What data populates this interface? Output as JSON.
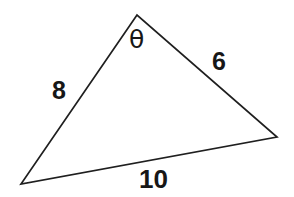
{
  "figure": {
    "type": "geometry-diagram",
    "shape": "triangle",
    "background_color": "#ffffff",
    "stroke_color": "#1f1f1f",
    "stroke_width": 1.7,
    "text_color": "#171717",
    "vertices": [
      {
        "name": "apex",
        "x": 137,
        "y": 15
      },
      {
        "name": "bottom-left",
        "x": 21,
        "y": 184
      },
      {
        "name": "right",
        "x": 277,
        "y": 137
      }
    ],
    "sides": [
      {
        "name": "left-side",
        "label": "8",
        "from": "apex",
        "to": "bottom-left"
      },
      {
        "name": "right-side",
        "label": "6",
        "from": "apex",
        "to": "right"
      },
      {
        "name": "bottom-side",
        "label": "10",
        "from": "bottom-left",
        "to": "right"
      }
    ],
    "angles": [
      {
        "name": "apex-angle",
        "label": "θ",
        "at": "apex"
      }
    ]
  },
  "labels": {
    "side_a": "8",
    "side_b": "6",
    "side_c": "10",
    "angle_theta": "θ"
  }
}
